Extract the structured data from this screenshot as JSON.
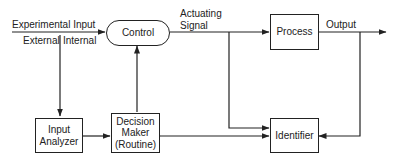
{
  "diagram": {
    "type": "block-diagram",
    "nodes": {
      "control": {
        "label": "Control"
      },
      "process": {
        "label": "Process"
      },
      "input_analyzer": {
        "line1": "Input",
        "line2": "Analyzer"
      },
      "decision_maker": {
        "line1": "Decision",
        "line2": "Maker",
        "line3": "(Routine)"
      },
      "identifier": {
        "label": "Identifier"
      }
    },
    "labels": {
      "experimental_input": "Experimental Input",
      "external": "External",
      "internal": "Internal",
      "actuating_line1": "Actuating",
      "actuating_line2": "Signal",
      "output": "Output"
    },
    "edges": [
      {
        "from": "experimental_input",
        "to": "control"
      },
      {
        "from": "control",
        "to": "process",
        "label": "Actuating Signal"
      },
      {
        "from": "process",
        "to": "output",
        "label": "Output"
      },
      {
        "from": "experimental_input",
        "to": "input_analyzer"
      },
      {
        "from": "input_analyzer",
        "to": "decision_maker"
      },
      {
        "from": "decision_maker",
        "to": "control"
      },
      {
        "from": "actuating_signal",
        "to": "identifier"
      },
      {
        "from": "output",
        "to": "identifier"
      },
      {
        "from": "decision_maker",
        "to": "identifier",
        "bidirectional": true
      }
    ],
    "line_color": "#222222"
  }
}
